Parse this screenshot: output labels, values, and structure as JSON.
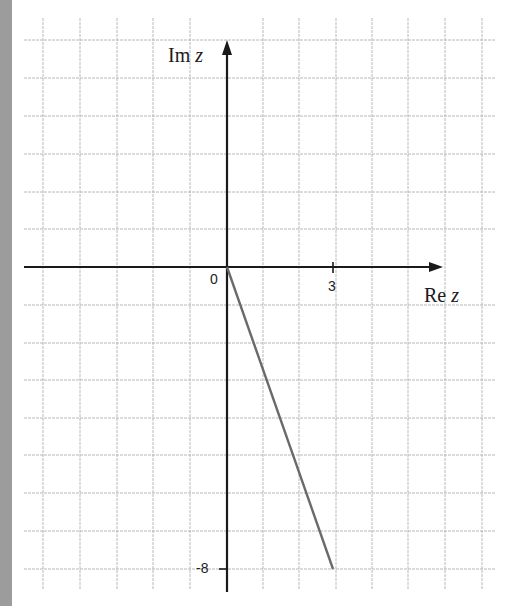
{
  "diagram": {
    "type": "complex-plane",
    "x_axis": {
      "label_main": "Re",
      "label_var": "z"
    },
    "y_axis": {
      "label_main": "Im",
      "label_var": "z"
    },
    "origin_label": "0",
    "tick_labels": {
      "x": "3",
      "y": "-8"
    },
    "segment": {
      "from": [
        0,
        0
      ],
      "to": [
        3,
        -8
      ],
      "color": "#6a6a6a"
    },
    "grid": {
      "x_range": [
        -5,
        7
      ],
      "y_range": [
        -8.8,
        6
      ],
      "unit_step": 1,
      "color": "#b5b5b5"
    },
    "colors": {
      "axis": "#1a1a1a",
      "gutter": "#9c9c9c",
      "background": "#ffffff"
    }
  }
}
